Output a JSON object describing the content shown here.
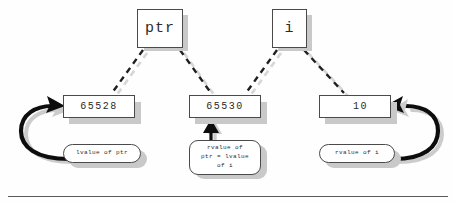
{
  "diagram": {
    "colors": {
      "line": "#1a1a1a",
      "shadow": "#c9c9c9",
      "shadow_light": "#d9d9d9",
      "box_border": "#4a4a4a",
      "background": "#fefefe",
      "text": "#2b2b2b"
    },
    "variables": [
      {
        "name": "ptr-variable-box",
        "label": "ptr"
      },
      {
        "name": "i-variable-box",
        "label": "i"
      }
    ],
    "memory_cells": [
      {
        "name": "cell-65528",
        "value": "65528"
      },
      {
        "name": "cell-65530",
        "value": "65530"
      },
      {
        "name": "cell-10",
        "value": "10"
      }
    ],
    "callouts": [
      {
        "name": "lvalue-of-ptr",
        "text": "lvalue of ptr"
      },
      {
        "name": "rvalue-of-ptr",
        "line1": "rvalue of",
        "line2": "ptr = lvalue",
        "line3": "of i"
      },
      {
        "name": "rvalue-of-i",
        "text": "rvalue of i"
      }
    ],
    "connections": [
      {
        "from": "ptr",
        "to": "65528",
        "style": "dashed"
      },
      {
        "from": "ptr",
        "to": "65530",
        "style": "dashed"
      },
      {
        "from": "i",
        "to": "65530",
        "style": "dashed"
      },
      {
        "from": "i",
        "to": "10",
        "style": "dashed"
      },
      {
        "from": "lvalue of ptr",
        "to": "65528",
        "style": "curved-arrow"
      },
      {
        "from": "rvalue of ptr = lvalue of i",
        "to": "65530",
        "style": "straight-arrow"
      },
      {
        "from": "rvalue of i",
        "to": "10",
        "style": "curved-arrow"
      }
    ]
  }
}
